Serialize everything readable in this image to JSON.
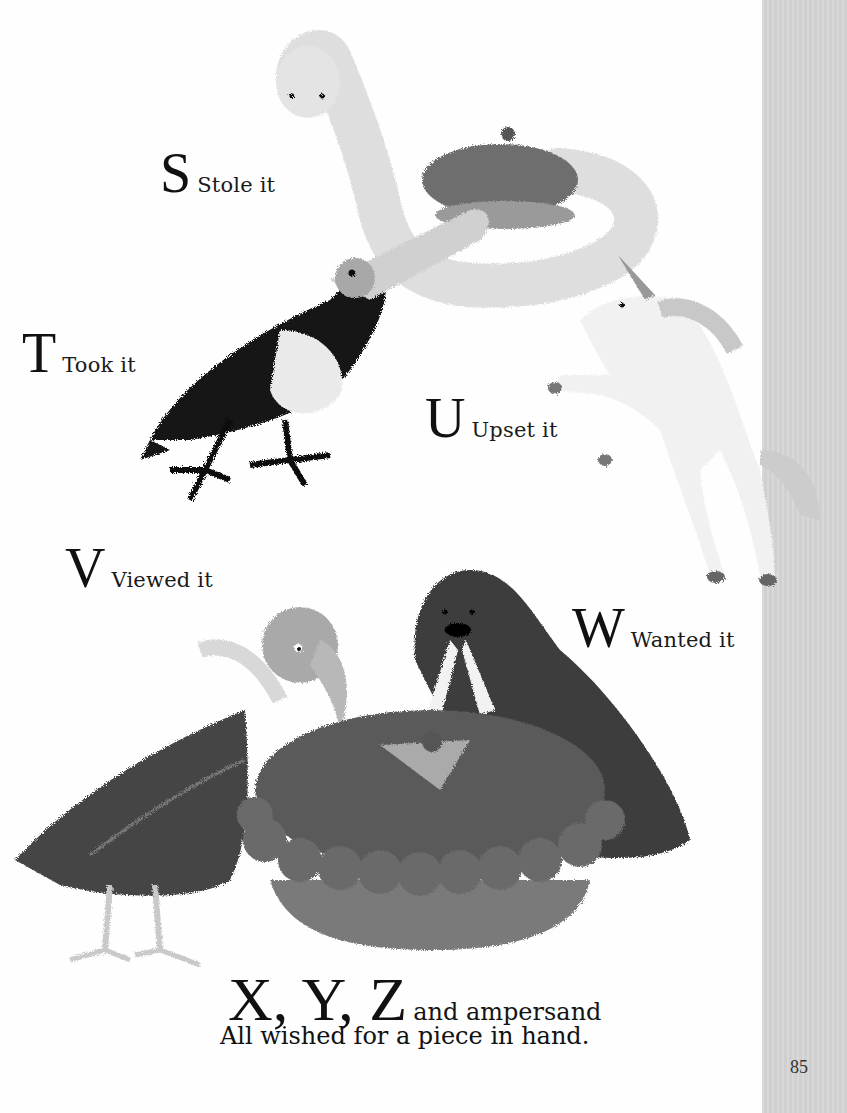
{
  "page": {
    "page_number": "85",
    "background_color": "#fefefe",
    "margin_strip_color": "#d4d4d4"
  },
  "labels": [
    {
      "letter": "S",
      "text": "Stole it"
    },
    {
      "letter": "T",
      "text": "Took it"
    },
    {
      "letter": "U",
      "text": "Upset it"
    },
    {
      "letter": "V",
      "text": "Viewed it"
    },
    {
      "letter": "W",
      "text": "Wanted it"
    }
  ],
  "closing": {
    "letters": "X, Y, Z",
    "tail": "and ampersand",
    "line2": "All wished for a piece in hand."
  },
  "illustrations": [
    {
      "name": "snake",
      "letter": "S",
      "description": "pale snake coiled around a pie"
    },
    {
      "name": "toucan",
      "letter": "T",
      "description": "black toucan with large pale beak"
    },
    {
      "name": "unicorn",
      "letter": "U",
      "description": "white rearing unicorn"
    },
    {
      "name": "vulture",
      "letter": "V",
      "description": "dark vulture with pale head"
    },
    {
      "name": "walrus",
      "letter": "W",
      "description": "dark walrus behind a large pie"
    },
    {
      "name": "pie",
      "description": "large pie with crimped crust"
    }
  ]
}
